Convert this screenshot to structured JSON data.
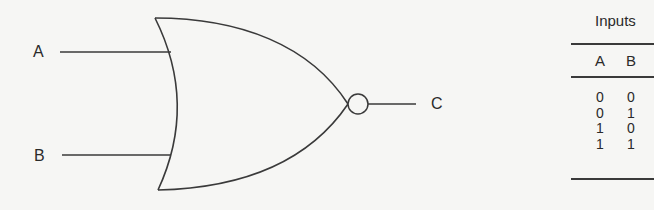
{
  "diagram": {
    "gate_type": "NOR",
    "inputs": [
      {
        "label": "A"
      },
      {
        "label": "B"
      }
    ],
    "output": {
      "label": "C"
    },
    "stroke_color": "#3a3a3a",
    "background": "#f6f6f4"
  },
  "truth_table": {
    "group_header": "Inputs",
    "columns": [
      "A",
      "B"
    ],
    "rows": [
      [
        "0",
        "0"
      ],
      [
        "0",
        "1"
      ],
      [
        "1",
        "0"
      ],
      [
        "1",
        "1"
      ]
    ]
  }
}
